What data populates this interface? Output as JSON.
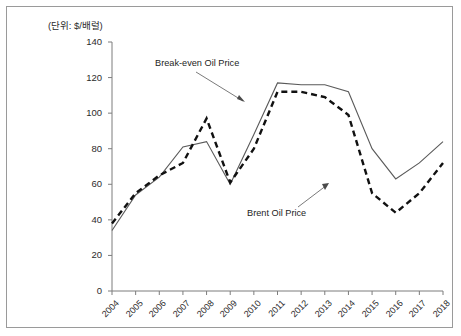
{
  "figure": {
    "unit_label": "(단위: $/배럴)",
    "frame_color": "#9a9a9a"
  },
  "chart_data": {
    "type": "line",
    "title": "",
    "subtitle": "",
    "xlabel": "",
    "ylabel": "",
    "unit": "$/배럴",
    "grid": false,
    "legend_position": "inline-annotation",
    "categories": [
      "2004",
      "2005",
      "2006",
      "2007",
      "2008",
      "2009",
      "2010",
      "2011",
      "2012",
      "2013",
      "2014",
      "2015",
      "2016",
      "2017",
      "2018"
    ],
    "x": [
      2004,
      2005,
      2006,
      2007,
      2008,
      2009,
      2010,
      2011,
      2012,
      2013,
      2014,
      2015,
      2016,
      2017,
      2018
    ],
    "ylim": [
      0,
      140
    ],
    "yticks": [
      0,
      20,
      40,
      60,
      80,
      100,
      120,
      140
    ],
    "series": [
      {
        "name": "Break-even Oil Price",
        "style": "solid",
        "color": "#5a5a5a",
        "values": [
          34,
          54,
          64,
          81,
          84,
          60,
          88,
          117,
          116,
          116,
          112,
          80,
          63,
          72,
          84
        ]
      },
      {
        "name": "Brent Oil Price",
        "style": "dashed",
        "color": "#111111",
        "values": [
          38,
          55,
          65,
          72,
          97,
          61,
          80,
          112,
          112,
          109,
          99,
          55,
          44,
          55,
          72
        ]
      }
    ],
    "annotations": [
      {
        "text": "Break-even Oil Price",
        "target_series": "Break-even Oil Price",
        "target_x": 2011
      },
      {
        "text": "Brent Oil Price",
        "target_series": "Brent Oil Price",
        "target_x": 2015
      }
    ]
  }
}
